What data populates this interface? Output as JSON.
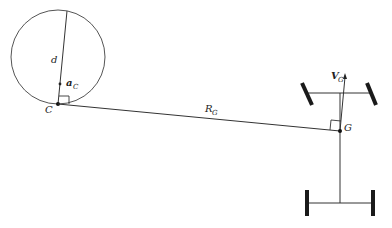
{
  "diagram": {
    "type": "vehicle kinematics (instantaneous center of rotation)",
    "colors": {
      "stroke": "#333333",
      "wheel": "#1a1a1a",
      "background": "#ffffff"
    },
    "labels": {
      "diameter": "d",
      "accel": "a",
      "accel_sub": "C",
      "point_c": "C",
      "radius": "R",
      "radius_sub": "G",
      "velocity": "V",
      "velocity_sub": "G",
      "point_g": "G"
    },
    "elements": {
      "circle": {
        "center": [
          58,
          57
        ],
        "radius": 47
      },
      "point_c": [
        58,
        104
      ],
      "point_g": [
        340,
        131
      ],
      "front_axle_y": 93,
      "rear_axle_y": 203
    }
  }
}
